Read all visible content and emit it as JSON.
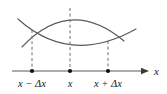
{
  "figure": {
    "kind": "calculus-secant-tangent-diagram",
    "background_color": "#ffffff",
    "width": 167,
    "height": 94,
    "curve_color": "#5a5a5a",
    "dash_color": "#6e6e6e",
    "axis_color": "#5a5a5a",
    "dot_color": "#111111",
    "text_color": "#1a1a1a"
  },
  "axis": {
    "name": "horizontal-axis",
    "label": "x",
    "arrow": "right-arrow",
    "y_position": 71,
    "x_start": 12,
    "x_end": 141
  },
  "ticks": [
    {
      "id": "left",
      "label": "x − Δx",
      "x": 32,
      "label_x": 32,
      "label_y": 87
    },
    {
      "id": "center",
      "label": "x",
      "x": 70,
      "label_x": 70,
      "label_y": 87
    },
    {
      "id": "right",
      "label": "x + Δx",
      "x": 108,
      "label_x": 108,
      "label_y": 87
    }
  ],
  "curves": [
    {
      "id": "arch",
      "name": "concave-down-curve",
      "description": "downward opening parabola peaking above x",
      "path": "M 22 47 Q 70 -4 124 41"
    },
    {
      "id": "valley",
      "name": "concave-up-curve",
      "description": "upward opening parabola with minimum near x",
      "path": "M 18 19 Q 70 66 136 29"
    }
  ],
  "dashed_lines": [
    {
      "id": "left",
      "name": "dashed-drop-left",
      "x": 32,
      "y_top": 30,
      "y_bottom": 70
    },
    {
      "id": "center",
      "name": "dashed-drop-center",
      "x": 70,
      "y_top": 8,
      "y_bottom": 70
    },
    {
      "id": "right",
      "name": "dashed-drop-right",
      "x": 108,
      "y_top": 41,
      "y_bottom": 70
    }
  ],
  "dots": [
    {
      "id": "left",
      "cx": 32,
      "cy": 71
    },
    {
      "id": "center",
      "cx": 70,
      "cy": 71
    },
    {
      "id": "right",
      "cx": 108,
      "cy": 71
    }
  ]
}
